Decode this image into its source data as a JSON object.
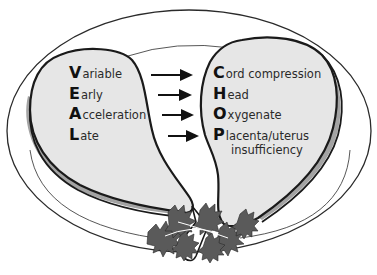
{
  "diagram": {
    "type": "mnemonic-illustration",
    "colors": {
      "meat_fill": "#e6e6e6",
      "meat_shadow": "#a3a3a3",
      "outline": "#1a1a1a",
      "plate_line": "#2a2a2a",
      "parsley": "#5a5a5a",
      "arrow": "#111111"
    },
    "left_cut": {
      "label": "VEAL",
      "items": [
        {
          "letter": "V",
          "rest": "ariable"
        },
        {
          "letter": "E",
          "rest": "arly"
        },
        {
          "letter": "A",
          "rest": "cceleration"
        },
        {
          "letter": "L",
          "rest": "ate"
        }
      ]
    },
    "right_cut": {
      "label": "CHOP",
      "items": [
        {
          "letter": "C",
          "rest": "ord compression"
        },
        {
          "letter": "H",
          "rest": "ead"
        },
        {
          "letter": "O",
          "rest": "xygenate"
        },
        {
          "letter": "P",
          "rest": "lacenta/uterus",
          "continuation": "insufficiency"
        }
      ]
    },
    "arrows": [
      {
        "from": "Variable",
        "to": "Cord compression",
        "icon": "right-arrow-icon"
      },
      {
        "from": "Early",
        "to": "Head",
        "icon": "right-arrow-icon"
      },
      {
        "from": "Acceleration",
        "to": "Oxygenate",
        "icon": "right-arrow-icon"
      },
      {
        "from": "Late",
        "to": "Placenta/uterus insufficiency",
        "icon": "right-arrow-icon"
      }
    ],
    "decorations": {
      "plate": "oval-plate-icon",
      "garnish": "parsley-icon"
    }
  }
}
